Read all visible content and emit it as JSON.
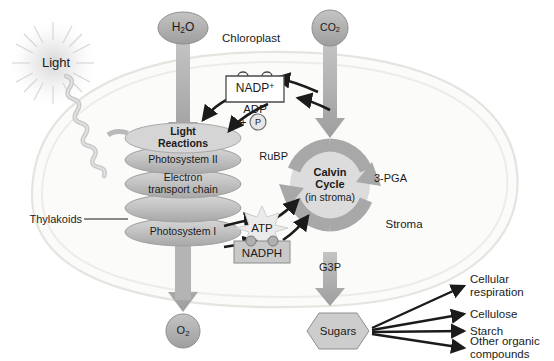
{
  "diagram": {
    "type": "biology-process-diagram"
  },
  "colors": {
    "cell_fill": "#fbfbfa",
    "cell_stroke": "#e2e2de",
    "gray_arrow": "#9c9c9c",
    "cycle_ring": "#a8a8a8",
    "cycle_fill": "#dcdcdc",
    "disc_fill": "#bdbdbd",
    "black_arrow": "#1b1b1b",
    "text": "#1b1b1b",
    "nadph_box": "#c9c9c9",
    "light_glow": "#d9d9d9"
  },
  "labels": {
    "light": "Light",
    "chloroplast": "Chloroplast",
    "stroma": "Stroma",
    "thylakoids": "Thylakoids"
  },
  "inputs": {
    "water": {
      "formula": "H",
      "sub": "2",
      "tail": "O",
      "shape": "ellipse"
    },
    "carbon_dioxide": {
      "formula": "CO",
      "sub": "2",
      "tail": "",
      "shape": "circle"
    }
  },
  "outputs": {
    "oxygen": {
      "formula": "O",
      "sub": "2",
      "shape": "circle"
    },
    "sugars": {
      "label": "Sugars",
      "shape": "hexagon"
    }
  },
  "thylakoid_stack": {
    "discs": [
      {
        "line1": "Light",
        "line2": "Reactions",
        "bold": true
      },
      {
        "line1": "Photosystem II",
        "line2": "",
        "bold": false
      },
      {
        "line1": "Electron",
        "line2": "transport chain",
        "bold": false
      },
      {
        "line1": "Photosystem I",
        "line2": "",
        "bold": false
      }
    ]
  },
  "calvin_cycle": {
    "line1": "Calvin",
    "line2": "Cycle",
    "line3": "(in stroma)",
    "input_label": "RuBP",
    "intermediate_label": "3-PGA",
    "output_label": "G3P"
  },
  "carriers": {
    "nadp_plus": {
      "text": "NADP",
      "charge": "+"
    },
    "adp": {
      "text": "ADP"
    },
    "phosphate": {
      "text": "P",
      "plus": "+"
    },
    "atp": {
      "text": "ATP"
    },
    "nadph": {
      "text": "NADPH",
      "electrons": 2
    }
  },
  "sugar_uses": [
    {
      "line1": "Cellular",
      "line2": "respiration"
    },
    {
      "line1": "Cellulose",
      "line2": ""
    },
    {
      "line1": "Starch",
      "line2": ""
    },
    {
      "line1": "Other organic",
      "line2": "compounds"
    }
  ]
}
